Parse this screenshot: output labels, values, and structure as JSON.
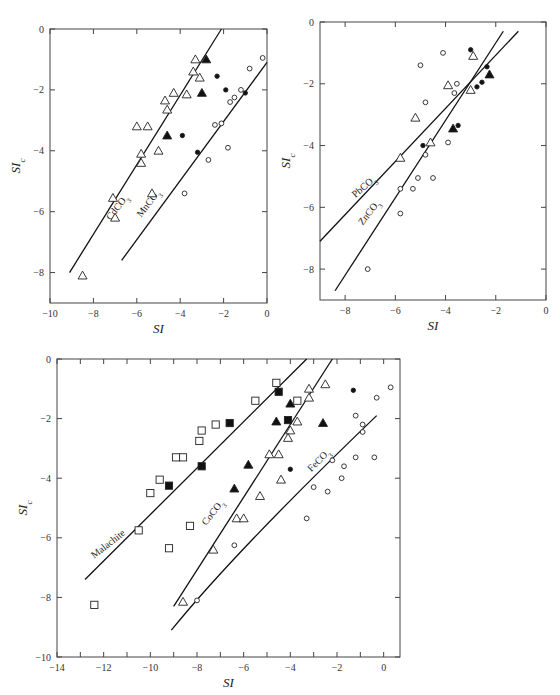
{
  "chart_data": [
    {
      "id": "top-left",
      "type": "scatter",
      "xlabel": "SI",
      "ylabel": "SIc",
      "xlim": [
        -10,
        0
      ],
      "ylim": [
        -9,
        0
      ],
      "xticks": [
        -10,
        -8,
        -6,
        -4,
        -2,
        0
      ],
      "yticks": [
        0,
        -2,
        -4,
        -6,
        -8
      ],
      "grid": false,
      "frame": {
        "left": 50,
        "right": 267,
        "top": 29,
        "bottom": 303
      },
      "lines": [
        {
          "label": "CdCO3",
          "x1": -9.1,
          "y1": -8.0,
          "x2": -2.1,
          "y2": 0.0,
          "label_pos": [
            -7.2,
            -6.3
          ],
          "label_angle": -52
        },
        {
          "label": "MnCO3",
          "x1": -6.7,
          "y1": -7.6,
          "x2": 0.0,
          "y2": -1.1,
          "label_pos": [
            -5.8,
            -6.2
          ],
          "label_angle": -52
        }
      ],
      "series": [
        {
          "name": "open-triangle",
          "marker": "triangle-open",
          "points": [
            [
              -3.3,
              -1.0
            ],
            [
              -3.4,
              -1.4
            ],
            [
              -3.1,
              -1.6
            ],
            [
              -4.3,
              -2.1
            ],
            [
              -3.7,
              -2.15
            ],
            [
              -4.7,
              -2.35
            ],
            [
              -4.6,
              -2.65
            ],
            [
              -6.0,
              -3.2
            ],
            [
              -5.5,
              -3.2
            ],
            [
              -5.8,
              -4.1
            ],
            [
              -5.8,
              -4.4
            ],
            [
              -5.0,
              -4.0
            ],
            [
              -7.1,
              -5.55
            ],
            [
              -5.3,
              -5.4
            ],
            [
              -7.0,
              -6.2
            ],
            [
              -8.5,
              -8.1
            ]
          ]
        },
        {
          "name": "filled-triangle",
          "marker": "triangle-filled",
          "points": [
            [
              -2.8,
              -1.0
            ],
            [
              -3.0,
              -2.1
            ],
            [
              -4.6,
              -3.5
            ]
          ]
        },
        {
          "name": "filled-circle",
          "marker": "circle-filled",
          "points": [
            [
              -2.3,
              -1.55
            ],
            [
              -1.9,
              -2.0
            ],
            [
              -1.0,
              -2.1
            ],
            [
              -3.9,
              -3.5
            ],
            [
              -3.2,
              -4.05
            ]
          ]
        },
        {
          "name": "open-circle",
          "marker": "circle-open",
          "points": [
            [
              -0.2,
              -0.95
            ],
            [
              -0.8,
              -1.3
            ],
            [
              -1.2,
              -2.0
            ],
            [
              -1.5,
              -2.25
            ],
            [
              -1.7,
              -2.4
            ],
            [
              -2.4,
              -3.15
            ],
            [
              -2.1,
              -3.1
            ],
            [
              -1.8,
              -3.9
            ],
            [
              -2.7,
              -4.3
            ],
            [
              -3.8,
              -5.4
            ]
          ]
        }
      ]
    },
    {
      "id": "top-right",
      "type": "scatter",
      "xlabel": "SI",
      "ylabel": "SIc",
      "xlim": [
        -9,
        0
      ],
      "ylim": [
        -9,
        0
      ],
      "xticks": [
        -8,
        -6,
        -4,
        -2,
        0
      ],
      "yticks": [
        0,
        -2,
        -4,
        -6,
        -8
      ],
      "grid": false,
      "frame": {
        "left": 320,
        "right": 546,
        "top": 22,
        "bottom": 300
      },
      "lines": [
        {
          "label": "PbCO3",
          "x1": -9.0,
          "y1": -7.1,
          "x2": -1.1,
          "y2": -0.3,
          "label_pos": [
            -7.6,
            -5.7
          ],
          "label_angle": -40
        },
        {
          "label": "ZnCO3",
          "x1": -8.4,
          "y1": -8.7,
          "x2": -1.7,
          "y2": -0.3,
          "label_pos": [
            -7.3,
            -6.6
          ],
          "label_angle": -52
        }
      ],
      "series": [
        {
          "name": "open-triangle",
          "marker": "triangle-open",
          "points": [
            [
              -2.9,
              -1.1
            ],
            [
              -3.9,
              -2.05
            ],
            [
              -3.0,
              -2.2
            ],
            [
              -5.2,
              -3.1
            ],
            [
              -4.6,
              -3.9
            ],
            [
              -5.8,
              -4.4
            ]
          ]
        },
        {
          "name": "filled-triangle",
          "marker": "triangle-filled",
          "points": [
            [
              -2.25,
              -1.7
            ],
            [
              -3.7,
              -3.45
            ]
          ]
        },
        {
          "name": "filled-circle",
          "marker": "circle-filled",
          "points": [
            [
              -3.0,
              -0.9
            ],
            [
              -2.35,
              -1.45
            ],
            [
              -2.55,
              -1.95
            ],
            [
              -2.75,
              -2.1
            ],
            [
              -3.5,
              -3.35
            ],
            [
              -4.9,
              -4.0
            ]
          ]
        },
        {
          "name": "open-circle",
          "marker": "circle-open",
          "points": [
            [
              -4.1,
              -1.0
            ],
            [
              -5.0,
              -1.4
            ],
            [
              -3.55,
              -2.0
            ],
            [
              -3.65,
              -2.3
            ],
            [
              -4.8,
              -2.6
            ],
            [
              -3.9,
              -3.9
            ],
            [
              -4.8,
              -4.3
            ],
            [
              -5.1,
              -5.05
            ],
            [
              -4.5,
              -5.05
            ],
            [
              -5.8,
              -5.4
            ],
            [
              -5.3,
              -5.4
            ],
            [
              -5.8,
              -6.2
            ],
            [
              -7.1,
              -8.0
            ]
          ]
        }
      ]
    },
    {
      "id": "bottom",
      "type": "scatter",
      "xlabel": "SI",
      "ylabel": "SIc",
      "xlim": [
        -14,
        0.7
      ],
      "ylim": [
        -10,
        0
      ],
      "xticks": [
        -14,
        -12,
        -10,
        -8,
        -6,
        -4,
        -2,
        0
      ],
      "yticks": [
        0,
        -2,
        -4,
        -6,
        -8,
        -10
      ],
      "grid": false,
      "frame": {
        "left": 57,
        "right": 400,
        "top": 359,
        "bottom": 657
      },
      "lines": [
        {
          "label": "Malachite",
          "x1": -12.8,
          "y1": -7.4,
          "x2": -3.3,
          "y2": 0.0,
          "label_pos": [
            -12.4,
            -6.7
          ],
          "label_angle": -38
        },
        {
          "label": "CoCO3",
          "x1": -9.0,
          "y1": -8.3,
          "x2": -2.2,
          "y2": 0.0,
          "label_pos": [
            -7.6,
            -5.6
          ],
          "label_angle": -52
        },
        {
          "label": "FeCO3",
          "x1": -9.1,
          "y1": -9.1,
          "x2": -0.3,
          "y2": -1.9,
          "curve_via": [
            -6.5,
            -6.5
          ],
          "label_pos": [
            -3.1,
            -3.8
          ],
          "label_angle": -45
        }
      ],
      "series": [
        {
          "name": "open-square",
          "marker": "square-open",
          "points": [
            [
              -4.6,
              -0.8
            ],
            [
              -3.7,
              -1.4
            ],
            [
              -5.5,
              -1.4
            ],
            [
              -7.2,
              -2.2
            ],
            [
              -7.8,
              -2.4
            ],
            [
              -7.9,
              -2.75
            ],
            [
              -8.6,
              -3.3
            ],
            [
              -8.9,
              -3.3
            ],
            [
              -9.6,
              -4.05
            ],
            [
              -10.0,
              -4.5
            ],
            [
              -10.5,
              -5.75
            ],
            [
              -8.3,
              -5.6
            ],
            [
              -9.2,
              -6.35
            ],
            [
              -12.4,
              -8.25
            ]
          ]
        },
        {
          "name": "filled-square",
          "marker": "square-filled",
          "points": [
            [
              -4.5,
              -1.1
            ],
            [
              -6.6,
              -2.15
            ],
            [
              -4.1,
              -2.05
            ],
            [
              -7.8,
              -3.6
            ],
            [
              -9.2,
              -4.25
            ]
          ]
        },
        {
          "name": "filled-triangle",
          "marker": "triangle-filled",
          "points": [
            [
              -4.0,
              -1.5
            ],
            [
              -4.6,
              -2.1
            ],
            [
              -2.6,
              -2.15
            ],
            [
              -5.8,
              -3.55
            ],
            [
              -6.4,
              -4.35
            ]
          ]
        },
        {
          "name": "open-triangle",
          "marker": "triangle-open",
          "points": [
            [
              -2.5,
              -0.85
            ],
            [
              -3.2,
              -1.0
            ],
            [
              -3.2,
              -1.3
            ],
            [
              -3.7,
              -2.1
            ],
            [
              -4.0,
              -2.4
            ],
            [
              -4.1,
              -2.65
            ],
            [
              -4.9,
              -3.2
            ],
            [
              -4.5,
              -3.2
            ],
            [
              -4.4,
              -4.05
            ],
            [
              -5.3,
              -4.6
            ],
            [
              -6.3,
              -5.35
            ],
            [
              -6.0,
              -5.35
            ],
            [
              -7.3,
              -6.4
            ],
            [
              -8.6,
              -8.15
            ]
          ]
        },
        {
          "name": "filled-circle",
          "marker": "circle-filled",
          "points": [
            [
              -1.3,
              -1.05
            ],
            [
              -4.0,
              -3.7
            ]
          ]
        },
        {
          "name": "open-circle",
          "marker": "circle-open",
          "points": [
            [
              0.3,
              -0.95
            ],
            [
              -0.3,
              -1.3
            ],
            [
              -1.2,
              -1.9
            ],
            [
              -0.9,
              -2.2
            ],
            [
              -0.9,
              -2.45
            ],
            [
              -2.2,
              -3.4
            ],
            [
              -1.2,
              -3.3
            ],
            [
              -0.4,
              -3.3
            ],
            [
              -1.7,
              -3.6
            ],
            [
              -1.8,
              -4.0
            ],
            [
              -3.0,
              -4.3
            ],
            [
              -2.4,
              -4.45
            ],
            [
              -3.3,
              -5.35
            ],
            [
              -6.4,
              -6.25
            ],
            [
              -8.0,
              -8.1
            ]
          ]
        }
      ]
    }
  ]
}
